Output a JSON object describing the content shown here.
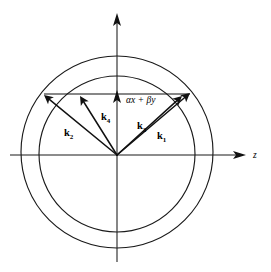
{
  "figure": {
    "name": "wave-vector-phase-matching-diagram",
    "background_color": "#ffffff",
    "ink_color": "#1a1a1a",
    "width": 271,
    "height": 272
  },
  "axes": {
    "horizontal": {
      "label": "z",
      "label_style": "italic",
      "x_start": 10,
      "x_end": 245,
      "y": 155,
      "arrow": "right"
    },
    "vertical": {
      "label": "",
      "x": 117,
      "y_start": 262,
      "y_end": 13,
      "arrow": "up"
    },
    "origin": {
      "x": 117,
      "y": 155
    }
  },
  "annotations": {
    "transverse_axis_label": {
      "alpha": "α",
      "x_sym": "x",
      "plus": "+",
      "beta": "β",
      "y_sym": "y",
      "full": "αx + βy",
      "x": 126,
      "y": 100
    }
  },
  "circles": [
    {
      "name": "outer-circle",
      "cx": 117,
      "cy": 152,
      "r": 96
    },
    {
      "name": "inner-circle",
      "cx": 117,
      "cy": 154,
      "r": 78
    }
  ],
  "vectors": [
    {
      "name": "k1",
      "label": "k",
      "subscript": "1",
      "x1": 117,
      "y1": 155,
      "x2": 190,
      "y2": 93,
      "label_x": 157,
      "label_y": 136
    },
    {
      "name": "k2",
      "label": "k",
      "subscript": "2",
      "x1": 117,
      "y1": 155,
      "x2": 44,
      "y2": 95,
      "label_x": 64,
      "label_y": 133
    },
    {
      "name": "k3",
      "label": "k",
      "subscript": "3",
      "x1": 117,
      "y1": 155,
      "x2": 182,
      "y2": 96,
      "label_x": 137,
      "label_y": 126
    },
    {
      "name": "k4",
      "label": "k",
      "subscript": "4",
      "x1": 117,
      "y1": 155,
      "x2": 80,
      "y2": 96,
      "label_x": 101,
      "label_y": 117
    }
  ],
  "chords": [
    {
      "name": "momentum-conservation-line",
      "x1": 44,
      "y1": 94,
      "x2": 190,
      "y2": 94
    }
  ]
}
